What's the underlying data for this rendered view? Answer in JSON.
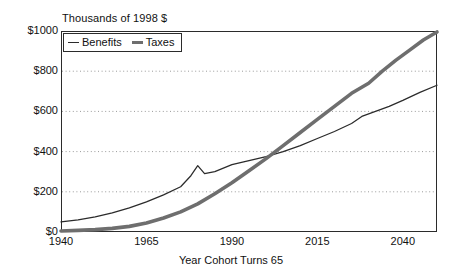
{
  "chart_data": {
    "type": "line",
    "title": "",
    "ylabel": "Thousands of 1998 $",
    "xlabel": "Year Cohort Turns 65",
    "xlim": [
      1940,
      2050
    ],
    "ylim": [
      0,
      1000
    ],
    "grid": true,
    "legend_position": "top-left",
    "y_ticks": [
      "$0",
      "$200",
      "$400",
      "$600",
      "$800",
      "$1000"
    ],
    "y_tick_values": [
      0,
      200,
      400,
      600,
      800,
      1000
    ],
    "x_ticks": [
      "1940",
      "1965",
      "1990",
      "2015",
      "2040"
    ],
    "x_tick_values": [
      1940,
      1965,
      1990,
      2015,
      2040
    ],
    "series": [
      {
        "name": "Benefits",
        "style": "thin",
        "color": "#2b2b2b",
        "x": [
          1940,
          1945,
          1950,
          1955,
          1960,
          1965,
          1970,
          1975,
          1978,
          1980,
          1982,
          1985,
          1990,
          1995,
          2000,
          2005,
          2010,
          2015,
          2020,
          2025,
          2028,
          2032,
          2036,
          2040,
          2045,
          2050
        ],
        "y": [
          50,
          60,
          75,
          95,
          120,
          150,
          185,
          225,
          280,
          330,
          290,
          300,
          335,
          355,
          375,
          400,
          430,
          465,
          500,
          540,
          575,
          600,
          625,
          655,
          695,
          730
        ]
      },
      {
        "name": "Taxes",
        "style": "thick",
        "color": "#6e6e6e",
        "x": [
          1940,
          1945,
          1950,
          1955,
          1960,
          1965,
          1970,
          1975,
          1980,
          1985,
          1990,
          1995,
          2000,
          2005,
          2010,
          2015,
          2020,
          2025,
          2028,
          2030,
          2034,
          2038,
          2042,
          2046,
          2050
        ],
        "y": [
          5,
          8,
          12,
          18,
          28,
          45,
          70,
          100,
          140,
          190,
          245,
          305,
          365,
          430,
          495,
          560,
          625,
          690,
          720,
          740,
          800,
          855,
          905,
          955,
          995
        ]
      }
    ]
  },
  "legend": {
    "entries": [
      {
        "label": "Benefits"
      },
      {
        "label": "Taxes"
      }
    ]
  }
}
